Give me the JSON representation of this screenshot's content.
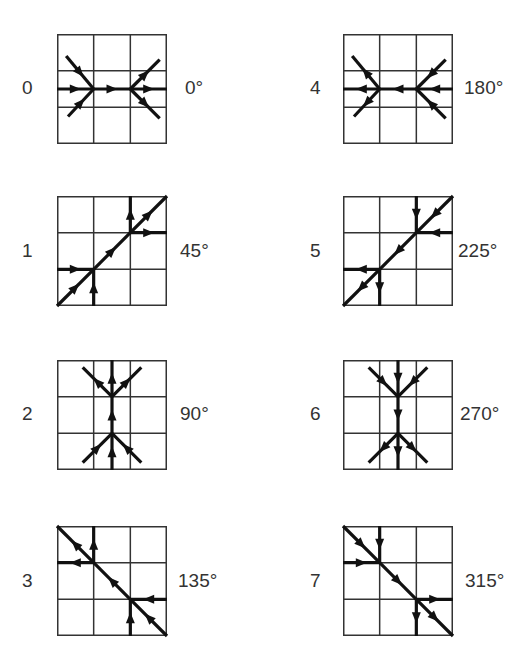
{
  "diagram": {
    "type": "direction-kernel-grid",
    "grid_size": 3,
    "panels": [
      {
        "index": "0",
        "angle": "0°",
        "column": 0,
        "row": 0
      },
      {
        "index": "1",
        "angle": "45°",
        "column": 0,
        "row": 1
      },
      {
        "index": "2",
        "angle": "90°",
        "column": 0,
        "row": 2
      },
      {
        "index": "3",
        "angle": "135°",
        "column": 0,
        "row": 3
      },
      {
        "index": "4",
        "angle": "180°",
        "column": 1,
        "row": 0
      },
      {
        "index": "5",
        "angle": "225°",
        "column": 1,
        "row": 1
      },
      {
        "index": "6",
        "angle": "270°",
        "column": 1,
        "row": 2
      },
      {
        "index": "7",
        "angle": "315°",
        "column": 1,
        "row": 3
      }
    ],
    "colors": {
      "line": "#111111",
      "grid": "#333333",
      "text": "#333333",
      "background": "#ffffff"
    }
  }
}
